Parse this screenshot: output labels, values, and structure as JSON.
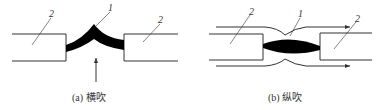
{
  "figures": [
    {
      "id": "a",
      "caption": "(a) 横吹",
      "labels": {
        "arc": "1",
        "contact_left": "2",
        "contact_right": "2"
      }
    },
    {
      "id": "b",
      "caption": "(b) 纵吹",
      "labels": {
        "arc": "1",
        "contact_left": "2",
        "contact_right": "2"
      }
    }
  ],
  "colors": {
    "line": "#333333",
    "arc": "#000000"
  }
}
